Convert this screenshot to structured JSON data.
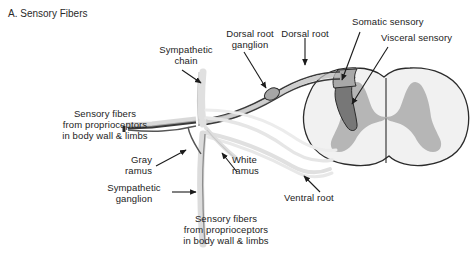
{
  "figure": {
    "panel_label": "A. Sensory Fibers",
    "background_color": "#ffffff",
    "ink_color": "#232323",
    "white_matter_color": "#f0f0f0",
    "gray_matter_color": "#b4b4b4",
    "ganglion_color": "#9a9a9a",
    "dark_tract_color": "#6e6e6e",
    "pale_nerve_color": "#e2e2e2"
  },
  "labels": {
    "sympathetic_chain": {
      "line1": "Sympathetic",
      "line2": "chain"
    },
    "dorsal_root_ganglion": {
      "line1": "Dorsal root",
      "line2": "ganglion"
    },
    "dorsal_root": {
      "line1": "Dorsal root"
    },
    "somatic_sensory": {
      "line1": "Somatic sensory"
    },
    "visceral_sensory": {
      "line1": "Visceral sensory"
    },
    "sensory_fibers_left": {
      "line1": "Sensory fibers",
      "line2": "from proprioceptors",
      "line3": "in body wall & limbs"
    },
    "gray_ramus": {
      "line1": "Gray",
      "line2": "ramus"
    },
    "white_ramus": {
      "line1": "White",
      "line2": "ramus"
    },
    "sympathetic_ganglion": {
      "line1": "Sympathetic",
      "line2": "ganglion"
    },
    "ventral_root": {
      "line1": "Ventral root"
    },
    "sensory_fibers_bottom": {
      "line1": "Sensory fibers",
      "line2": "from proprioceptors",
      "line3": "in body wall & limbs"
    }
  }
}
